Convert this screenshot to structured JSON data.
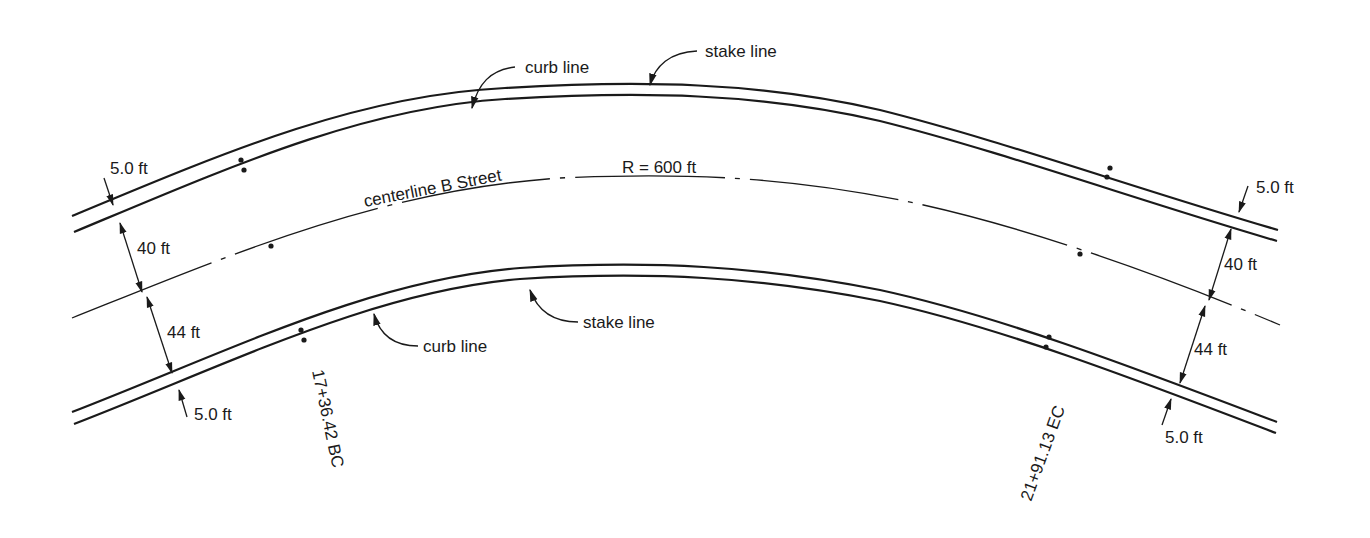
{
  "diagram": {
    "colors": {
      "ink": "#1a1a1a",
      "background": "#ffffff"
    },
    "labels": {
      "curb_line_top": "curb line",
      "stake_line_top": "stake line",
      "curb_line_bottom": "curb line",
      "stake_line_bottom": "stake line",
      "centerline": "centerline B Street",
      "radius": "R = 600 ft"
    },
    "dimensions": {
      "left_top_offset": "5.0 ft",
      "left_top_width": "40 ft",
      "left_bottom_width": "44 ft",
      "left_bottom_offset": "5.0 ft",
      "right_top_offset": "5.0 ft",
      "right_top_width": "40 ft",
      "right_bottom_width": "44 ft",
      "right_bottom_offset": "5.0 ft"
    },
    "stations": {
      "bc": "17+36.42 BC",
      "ec": "21+91.13 EC"
    }
  }
}
